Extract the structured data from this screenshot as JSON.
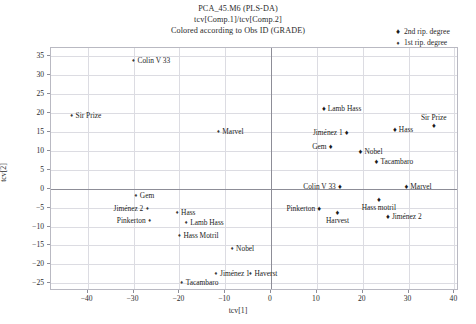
{
  "title": {
    "line1": "PCA_45.M6 (PLS-DA)",
    "line2": "tcv[Comp.1]/tcv[Comp.2]",
    "line3": "Colored according to Obs ID (GRADE)"
  },
  "legend": {
    "position": "top-right",
    "items": [
      {
        "label": "2nd rip. degree",
        "marker": "filled-diamond",
        "series": "deg2"
      },
      {
        "label": "1st rip. degree",
        "marker": "small-diamond",
        "series": "deg1"
      }
    ]
  },
  "chart_data": {
    "type": "scatter",
    "title": "PCA_45.M6 (PLS-DA)",
    "subtitle": "tcv[Comp.1]/tcv[Comp.2]",
    "note": "Colored according to Obs ID (GRADE)",
    "xlabel": "tcv[1]",
    "ylabel": "tcv[2]",
    "xlim": [
      -48,
      41
    ],
    "ylim": [
      -27,
      37
    ],
    "xticks": [
      -40,
      -30,
      -20,
      -10,
      0,
      10,
      20,
      30,
      40
    ],
    "yticks": [
      35,
      30,
      25,
      20,
      15,
      10,
      5,
      0,
      -5,
      -10,
      -15,
      -20,
      -25
    ],
    "grid": true,
    "series": [
      {
        "name": "1st rip. degree",
        "marker": "small-diamond",
        "points": [
          {
            "label": "Colin V 33",
            "x": -30.0,
            "y": 33.5,
            "label_side": "right"
          },
          {
            "label": "Sir Prize",
            "x": -43.5,
            "y": 19.0,
            "label_side": "right"
          },
          {
            "label": "Marvel",
            "x": -11.5,
            "y": 15.0,
            "label_side": "right"
          },
          {
            "label": "Gem",
            "x": -29.5,
            "y": -2.0,
            "label_side": "right"
          },
          {
            "label": "Jiménez 2",
            "x": -27.0,
            "y": -5.5,
            "label_side": "left"
          },
          {
            "label": "Hass",
            "x": -20.5,
            "y": -6.5,
            "label_side": "right"
          },
          {
            "label": "Pinkerton",
            "x": -26.5,
            "y": -8.5,
            "label_side": "left"
          },
          {
            "label": "Lamb Hass",
            "x": -18.5,
            "y": -9.0,
            "label_side": "right"
          },
          {
            "label": "Hass Motril",
            "x": -20.0,
            "y": -12.5,
            "label_side": "right"
          },
          {
            "label": "Nobel",
            "x": -8.5,
            "y": -16.0,
            "label_side": "right"
          },
          {
            "label": "Jiménez 1",
            "x": -12.0,
            "y": -22.5,
            "label_side": "right"
          },
          {
            "label": "Haverst",
            "x": -4.5,
            "y": -22.5,
            "label_side": "right"
          },
          {
            "label": "Tacambaro",
            "x": -19.5,
            "y": -25.0,
            "label_side": "right"
          }
        ]
      },
      {
        "name": "2nd rip. degree",
        "marker": "filled-diamond",
        "points": [
          {
            "label": "Sir Prize",
            "x": 35.5,
            "y": 16.5,
            "label_side": "above-right"
          },
          {
            "label": "Hass",
            "x": 27.0,
            "y": 15.5,
            "label_side": "right"
          },
          {
            "label": "Jiménez 1",
            "x": 16.5,
            "y": 14.5,
            "label_side": "left"
          },
          {
            "label": "Lamb Hass",
            "x": 11.5,
            "y": 21.0,
            "label_side": "right"
          },
          {
            "label": "Gem",
            "x": 13.0,
            "y": 11.0,
            "label_side": "left"
          },
          {
            "label": "Nobel",
            "x": 19.5,
            "y": 9.5,
            "label_side": "right"
          },
          {
            "label": "Tacambaro",
            "x": 23.0,
            "y": 7.0,
            "label_side": "right"
          },
          {
            "label": "Marvel",
            "x": 29.5,
            "y": 0.5,
            "label_side": "right"
          },
          {
            "label": "Colin V 33",
            "x": 15.0,
            "y": 0.5,
            "label_side": "left"
          },
          {
            "label": "Hass motril",
            "x": 23.5,
            "y": -3.0,
            "label_side": "below"
          },
          {
            "label": "Pinkerton",
            "x": 10.5,
            "y": -5.5,
            "label_side": "left"
          },
          {
            "label": "Harvest",
            "x": 14.5,
            "y": -6.5,
            "label_side": "below"
          },
          {
            "label": "Jiménez 2",
            "x": 25.5,
            "y": -7.5,
            "label_side": "right"
          }
        ]
      }
    ]
  }
}
